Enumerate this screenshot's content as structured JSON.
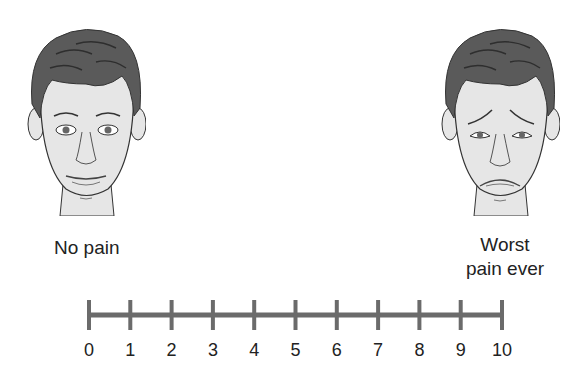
{
  "diagram": {
    "type": "pain-rating-scale",
    "faces": [
      {
        "position": "left",
        "expression": "neutral-calm-face",
        "label": "No pain"
      },
      {
        "position": "right",
        "expression": "distressed-face",
        "label_lines": [
          "Worst",
          "pain ever"
        ]
      }
    ],
    "scale": {
      "min": 0,
      "max": 10,
      "ticks": [
        "0",
        "1",
        "2",
        "3",
        "4",
        "5",
        "6",
        "7",
        "8",
        "9",
        "10"
      ],
      "line_color": "#6b6b6b"
    },
    "colors": {
      "hair": "#5a5a5a",
      "skin": "#e6e6e6",
      "outline": "#333333",
      "text": "#222222"
    }
  }
}
